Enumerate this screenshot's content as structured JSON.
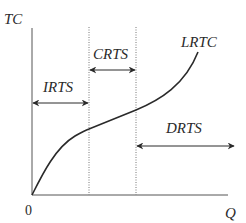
{
  "diagram": {
    "type": "long-run total cost curve with returns to scale regions",
    "axes": {
      "y_label": "TC",
      "x_label": "Q",
      "origin_label": "0"
    },
    "curve": {
      "label": "LRTC",
      "color": "#2a2a2a"
    },
    "regions": [
      {
        "label": "IRTS",
        "meaning": "increasing returns to scale"
      },
      {
        "label": "CRTS",
        "meaning": "constant returns to scale"
      },
      {
        "label": "DRTS",
        "meaning": "decreasing returns to scale"
      }
    ],
    "colors": {
      "line": "#2a2a2a",
      "axis": "#555555",
      "dotted": "#777777",
      "background": "#ffffff"
    }
  }
}
